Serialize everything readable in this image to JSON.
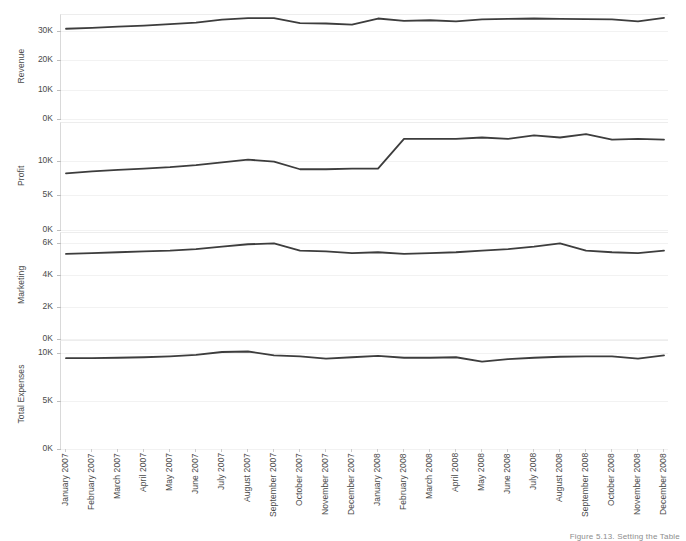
{
  "figure": {
    "caption": "Figure 5.13. Setting the Table",
    "line_color": "#3d3d3d",
    "axis_color": "#d9d9d9",
    "grid_color": "#f2f2f2",
    "text_color": "#4a4a4a",
    "background": "#ffffff"
  },
  "chart_data": {
    "type": "line",
    "title": "",
    "xlabel": "",
    "grid": true,
    "legend": "none",
    "layout": "4 stacked panels sharing one x axis",
    "x": [
      "January 2007",
      "February 2007",
      "March 2007",
      "April 2007",
      "May 2007",
      "June 2007",
      "July 2007",
      "August 2007",
      "September 2007",
      "October 2007",
      "November 2007",
      "December 2007",
      "January 2008",
      "February 2008",
      "March 2008",
      "April 2008",
      "May 2008",
      "June 2008",
      "July 2008",
      "August 2008",
      "September 2008",
      "October 2008",
      "November 2008",
      "December 2008"
    ],
    "panels": [
      {
        "ylabel": "Revenue",
        "yticks": [
          0,
          10000,
          20000,
          30000
        ],
        "yticklabels": [
          "0K",
          "10K",
          "20K",
          "30K"
        ],
        "ylim": [
          0,
          35500
        ],
        "values": [
          30800,
          31100,
          31500,
          31900,
          32400,
          32900,
          33900,
          34400,
          34400,
          32700,
          32600,
          32200,
          34300,
          33500,
          33700,
          33300,
          34000,
          34200,
          34300,
          34200,
          34100,
          34000,
          33300,
          34500
        ]
      },
      {
        "ylabel": "Profit",
        "yticks": [
          0,
          5000,
          10000
        ],
        "yticklabels": [
          "0K",
          "5K",
          "10K"
        ],
        "ylim": [
          0,
          15500
        ],
        "values": [
          8200,
          8500,
          8700,
          8900,
          9100,
          9400,
          9800,
          10200,
          9900,
          8800,
          8800,
          8900,
          8900,
          13200,
          13200,
          13200,
          13400,
          13200,
          13700,
          13400,
          13900,
          13100,
          13200,
          13100,
          13500
        ]
      },
      {
        "ylabel": "Marketing",
        "yticks": [
          0,
          2000,
          4000,
          6000
        ],
        "yticklabels": [
          "0K",
          "2K",
          "4K",
          "6K"
        ],
        "ylim": [
          0,
          6600
        ],
        "values": [
          5300,
          5350,
          5400,
          5450,
          5500,
          5600,
          5750,
          5900,
          5950,
          5500,
          5450,
          5350,
          5400,
          5300,
          5350,
          5400,
          5500,
          5600,
          5750,
          5950,
          5500,
          5400,
          5350,
          5500
        ]
      },
      {
        "ylabel": "Total Expenses",
        "yticks": [
          0,
          5000,
          10000
        ],
        "yticklabels": [
          "0K",
          "5K",
          "10K"
        ],
        "ylim": [
          0,
          11300
        ],
        "values": [
          9500,
          9500,
          9550,
          9600,
          9700,
          9850,
          10150,
          10200,
          9800,
          9700,
          9450,
          9600,
          9750,
          9550,
          9550,
          9600,
          9150,
          9400,
          9550,
          9650,
          9700,
          9700,
          9450,
          9800
        ]
      }
    ]
  }
}
